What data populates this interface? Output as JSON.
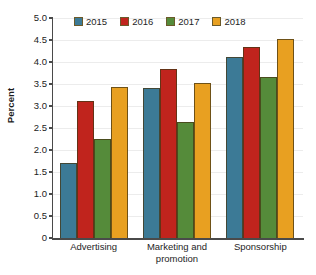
{
  "chart_data": {
    "type": "bar",
    "title": "",
    "xlabel": "",
    "ylabel": "Percent",
    "ylim": [
      0,
      5.0
    ],
    "ytick_labels": [
      "5.0",
      "4.5",
      "4.0",
      "3.5",
      "3.0",
      "2.5",
      "2.0",
      "1.5",
      "1.0",
      "0.5",
      "0"
    ],
    "ytick_values": [
      5.0,
      4.5,
      4.0,
      3.5,
      3.0,
      2.5,
      2.0,
      1.5,
      1.0,
      0.5,
      0
    ],
    "grid": true,
    "legend_position": "top-center",
    "categories": [
      "Advertising",
      "Marketing and promotion",
      "Sponsorship"
    ],
    "series": [
      {
        "name": "2015",
        "color": "#3c7a96",
        "values": [
          1.71,
          3.42,
          4.12
        ]
      },
      {
        "name": "2016",
        "color": "#c0241d",
        "values": [
          3.12,
          3.84,
          4.33
        ]
      },
      {
        "name": "2017",
        "color": "#558b3a",
        "values": [
          2.24,
          2.63,
          3.65
        ]
      },
      {
        "name": "2018",
        "color": "#e8a021",
        "values": [
          3.43,
          3.52,
          4.52
        ]
      }
    ]
  },
  "caption": {
    "text": ""
  }
}
